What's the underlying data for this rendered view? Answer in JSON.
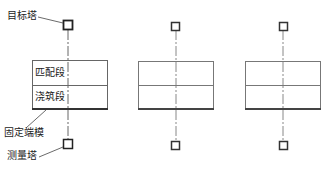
{
  "diagram": {
    "type": "construction-layout",
    "labels": {
      "target_tower": "目标塔",
      "matching_segment": "匹配段",
      "casting_segment": "浇筑段",
      "fixed_end_form": "固定端模",
      "survey_tower": "测量塔"
    },
    "units": [
      {
        "id": 1,
        "labeled": true
      },
      {
        "id": 2,
        "labeled": false
      },
      {
        "id": 3,
        "labeled": false
      }
    ],
    "colors": {
      "line": "#555555",
      "thick_line": "#333333",
      "text": "#222222",
      "background": "#ffffff"
    }
  }
}
